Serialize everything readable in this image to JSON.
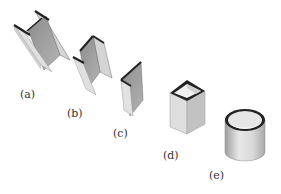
{
  "figure": {
    "items": [
      {
        "id": "a",
        "label": "(a)",
        "shape": "i-beam"
      },
      {
        "id": "b",
        "label": "(b)",
        "shape": "channel"
      },
      {
        "id": "c",
        "label": "(c)",
        "shape": "angle"
      },
      {
        "id": "d",
        "label": "(d)",
        "shape": "square-tube"
      },
      {
        "id": "e",
        "label": "(e)",
        "shape": "circular-tube"
      }
    ]
  },
  "colors": {
    "face_light": "#e2e2e2",
    "face_mid": "#c4c4c4",
    "face_dark": "#9a9a9a",
    "edge": "#222222"
  }
}
